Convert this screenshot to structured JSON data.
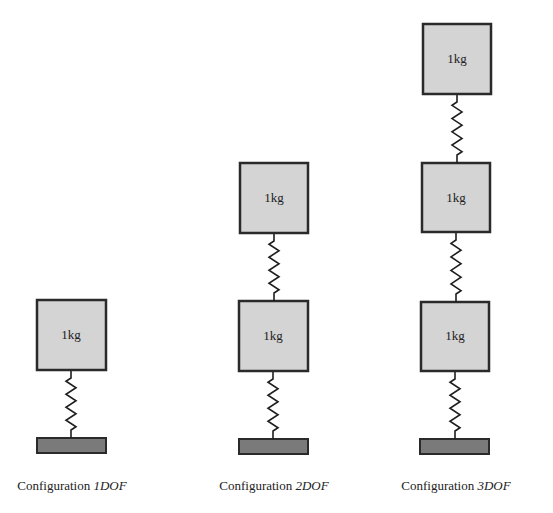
{
  "configurations": [
    {
      "id": "1dof",
      "caption_prefix": "Configuration ",
      "caption_name": "1DOF",
      "masses": [
        "1kg"
      ]
    },
    {
      "id": "2dof",
      "caption_prefix": "Configuration ",
      "caption_name": "2DOF",
      "masses": [
        "1kg",
        "1kg"
      ]
    },
    {
      "id": "3dof",
      "caption_prefix": "Configuration ",
      "caption_name": "3DOF",
      "masses": [
        "1kg",
        "1kg",
        "1kg"
      ]
    }
  ],
  "colors": {
    "mass_fill": "#d4d4d4",
    "ground_fill": "#7a7a7a",
    "outline": "#2a2a2a"
  }
}
